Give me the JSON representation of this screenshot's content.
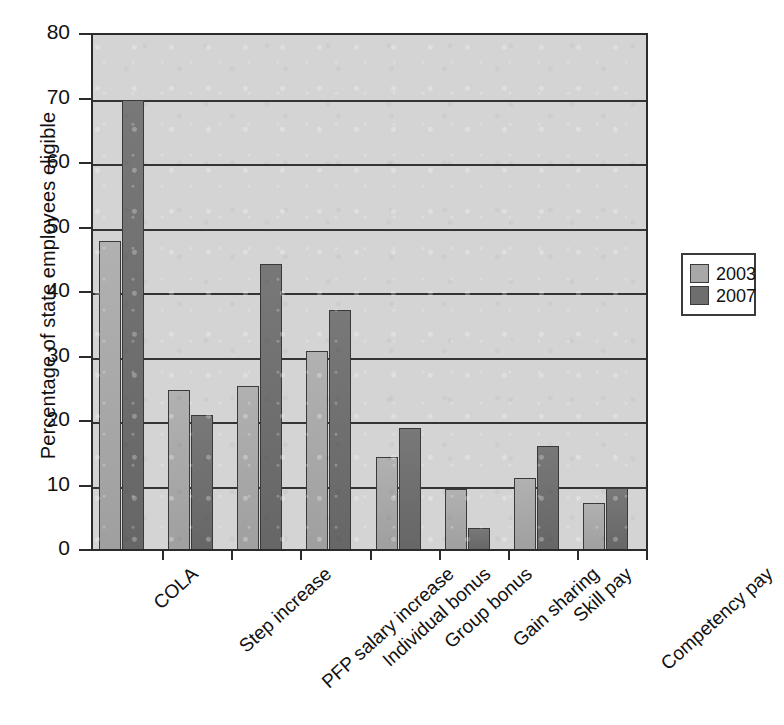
{
  "chart_data": {
    "type": "bar",
    "title": "",
    "subtitle": "",
    "xlabel": "",
    "ylabel": "Percentage of state employees eligible",
    "ylim": [
      0,
      80
    ],
    "yticks": [
      0,
      10,
      20,
      30,
      40,
      50,
      60,
      70,
      80
    ],
    "ytick_labels": [
      "0",
      "10",
      "20",
      "30",
      "40",
      "50",
      "60",
      "70",
      "80"
    ],
    "grid": "horizontal",
    "legend_position": "right-outside",
    "categories": [
      "COLA",
      "Step increase",
      "PFP salary increase",
      "Individual bonus",
      "Group bonus",
      "Gain sharing",
      "Skill pay",
      "Competency pay"
    ],
    "series": [
      {
        "name": "2003",
        "color": "#a8a8a8",
        "values": [
          48.0,
          25.0,
          25.6,
          31.0,
          14.6,
          9.6,
          11.3,
          7.4
        ]
      },
      {
        "name": "2007",
        "color": "#6e6e6e",
        "values": [
          70.0,
          21.1,
          44.5,
          37.3,
          19.0,
          3.5,
          16.3,
          9.7
        ]
      }
    ],
    "legend": [
      {
        "label": "2003",
        "color": "#a8a8a8"
      },
      {
        "label": "2007",
        "color": "#6e6e6e"
      }
    ]
  },
  "style": {
    "plot_background": "#d4d4d4",
    "axis_color": "#2b2b2b",
    "grid_color": "#343434",
    "page_background": "#ffffff"
  }
}
